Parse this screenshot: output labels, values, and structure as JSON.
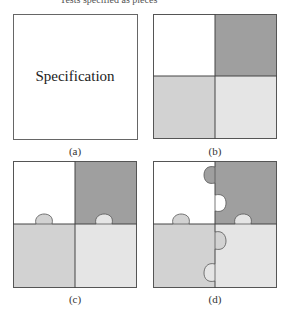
{
  "figure": {
    "top_cut_text": "Tests specified as pieces",
    "panels": [
      {
        "id": "a",
        "caption": "(a)",
        "center_text": "Specification"
      },
      {
        "id": "b",
        "caption": "(b)"
      },
      {
        "id": "c",
        "caption": "(c)"
      },
      {
        "id": "d",
        "caption": "(d)"
      }
    ],
    "colors": {
      "white_piece": "#ffffff",
      "dark_piece": "#9f9f9f",
      "light_piece": "#d2d2d2",
      "lighter_piece": "#e5e5e5",
      "border": "#555555"
    }
  }
}
